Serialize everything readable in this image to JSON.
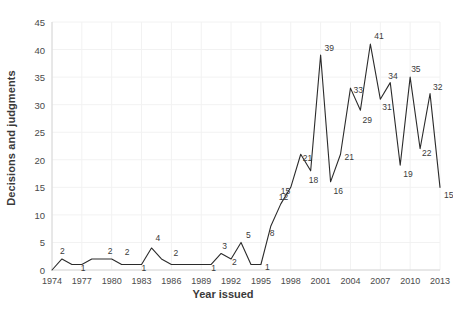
{
  "chart_data": {
    "type": "line",
    "title": "",
    "xlabel": "Year issued",
    "ylabel": "Decisions and judgments",
    "xlim": [
      1974,
      2013
    ],
    "ylim": [
      0,
      45
    ],
    "yticks": [
      0,
      5,
      10,
      15,
      20,
      25,
      30,
      35,
      40,
      45
    ],
    "xticks": [
      1974,
      1977,
      1980,
      1983,
      1986,
      1989,
      1992,
      1995,
      1998,
      2001,
      2004,
      2007,
      2010,
      2013
    ],
    "grid": true,
    "legend": "none",
    "line_color": "#2b2b2b",
    "x": [
      1974,
      1975,
      1976,
      1977,
      1978,
      1979,
      1980,
      1981,
      1982,
      1983,
      1984,
      1985,
      1986,
      1987,
      1988,
      1989,
      1990,
      1991,
      1992,
      1993,
      1994,
      1995,
      1996,
      1997,
      1998,
      1999,
      2000,
      2001,
      2002,
      2003,
      2004,
      2005,
      2006,
      2007,
      2008,
      2009,
      2010,
      2011,
      2012,
      2013
    ],
    "values": [
      0,
      2,
      1,
      1,
      2,
      2,
      2,
      1,
      1,
      1,
      4,
      2,
      1,
      1,
      1,
      1,
      1,
      3,
      2,
      5,
      1,
      1,
      8,
      12,
      15,
      21,
      18,
      39,
      16,
      21,
      33,
      29,
      41,
      31,
      34,
      19,
      35,
      22,
      32,
      15
    ],
    "point_labels": [
      {
        "x": 1975,
        "y": 2,
        "text": "2"
      },
      {
        "x": 1977,
        "y": 1,
        "text": "1"
      },
      {
        "x": 1980,
        "y": 2,
        "text": "2"
      },
      {
        "x": 1981,
        "y": 2,
        "text": "2"
      },
      {
        "x": 1983,
        "y": 1,
        "text": "1"
      },
      {
        "x": 1984,
        "y": 4,
        "text": "4"
      },
      {
        "x": 1986,
        "y": 2,
        "text": "2"
      },
      {
        "x": 1990,
        "y": 1,
        "text": "1"
      },
      {
        "x": 1991,
        "y": 3,
        "text": "3"
      },
      {
        "x": 1992,
        "y": 2,
        "text": "2"
      },
      {
        "x": 1993,
        "y": 5,
        "text": "5"
      },
      {
        "x": 1995,
        "y": 1,
        "text": "1"
      },
      {
        "x": 1996,
        "y": 8,
        "text": "8"
      },
      {
        "x": 1997,
        "y": 12,
        "text": "12"
      },
      {
        "x": 1998,
        "y": 15,
        "text": "15"
      },
      {
        "x": 1999,
        "y": 21,
        "text": "21"
      },
      {
        "x": 2000,
        "y": 18,
        "text": "18"
      },
      {
        "x": 2001,
        "y": 39,
        "text": "39"
      },
      {
        "x": 2002,
        "y": 16,
        "text": "16"
      },
      {
        "x": 2003,
        "y": 21,
        "text": "21"
      },
      {
        "x": 2004,
        "y": 33,
        "text": "33"
      },
      {
        "x": 2005,
        "y": 29,
        "text": "29"
      },
      {
        "x": 2006,
        "y": 41,
        "text": "41"
      },
      {
        "x": 2007,
        "y": 31,
        "text": "31"
      },
      {
        "x": 2008,
        "y": 34,
        "text": "34"
      },
      {
        "x": 2009,
        "y": 19,
        "text": "19"
      },
      {
        "x": 2010,
        "y": 35,
        "text": "35"
      },
      {
        "x": 2011,
        "y": 22,
        "text": "22"
      },
      {
        "x": 2012,
        "y": 32,
        "text": "32"
      },
      {
        "x": 2013,
        "y": 15,
        "text": "15"
      }
    ]
  }
}
